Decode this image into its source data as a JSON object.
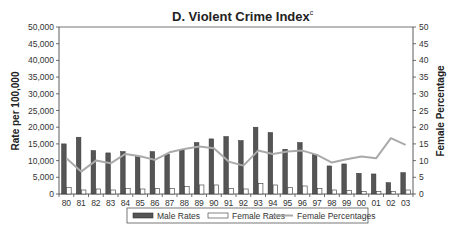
{
  "chart_data": {
    "type": "bar",
    "title": "D. Violent Crime Index",
    "title_superscript": "c",
    "xlabel": "",
    "ylabel": "Rate per 100,000",
    "y2label": "Female Percentage",
    "ylim": [
      0,
      50000
    ],
    "y2lim": [
      0,
      50
    ],
    "yticks": [
      "0",
      "5,000",
      "10,000",
      "15,000",
      "20,000",
      "25,000",
      "30,000",
      "35,000",
      "40,000",
      "45,000",
      "50,000"
    ],
    "y2ticks": [
      "0",
      "5",
      "10",
      "15",
      "20",
      "25",
      "30",
      "35",
      "40",
      "45",
      "50"
    ],
    "grid": false,
    "legend_position": "bottom",
    "categories": [
      "80",
      "81",
      "82",
      "83",
      "84",
      "85",
      "86",
      "87",
      "88",
      "89",
      "90",
      "91",
      "92",
      "93",
      "94",
      "95",
      "96",
      "97",
      "98",
      "99",
      "00",
      "01",
      "02",
      "03"
    ],
    "series": [
      {
        "name": "Male Rates",
        "type": "bar",
        "axis": "left",
        "color": "#555555",
        "values": [
          15000,
          17000,
          13000,
          12300,
          12700,
          11200,
          12700,
          11900,
          13200,
          15400,
          16500,
          17200,
          16000,
          20000,
          18400,
          13400,
          15400,
          11900,
          8400,
          9000,
          6200,
          6000,
          3400,
          6400
        ]
      },
      {
        "name": "Female Rates",
        "type": "bar",
        "axis": "left",
        "color": "#ffffff",
        "values": [
          2000,
          1200,
          1500,
          1200,
          1700,
          1500,
          1600,
          1700,
          2200,
          2700,
          2700,
          1700,
          1500,
          3200,
          2700,
          2000,
          2400,
          1700,
          1200,
          1000,
          800,
          800,
          800,
          1200
        ]
      },
      {
        "name": "Female Percentages",
        "type": "line",
        "axis": "right",
        "color": "#aaaaaa",
        "values": [
          10.7,
          6.7,
          10,
          9.2,
          12,
          11.3,
          10.2,
          12.5,
          13.5,
          14.2,
          13.7,
          9.7,
          8.5,
          13,
          12,
          12.7,
          13,
          11.7,
          9.4,
          10.4,
          11.2,
          10.7,
          16.7,
          14.7
        ]
      }
    ]
  },
  "legend": {
    "items": [
      {
        "label": "Male Rates"
      },
      {
        "label": "Female Rates"
      },
      {
        "label": "Female Percentages"
      }
    ]
  }
}
